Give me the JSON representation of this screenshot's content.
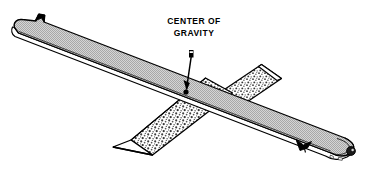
{
  "figure": {
    "type": "technical-line-illustration",
    "background_color": "#ffffff",
    "ink_color": "#000000",
    "annotation": {
      "label_line_1": "CENTER OF",
      "label_line_2": "GRAVITY",
      "label_x": 194,
      "label_y_line_1": 24,
      "label_y_line_2": 36,
      "pointer": {
        "kind": "arrow-with-dot",
        "from_x": 191,
        "from_y": 51,
        "to_x": 186,
        "to_y": 92,
        "dot_radius": 2.6,
        "dot_color": "#000000",
        "tail_flag": true
      }
    },
    "ruler": {
      "name": "steel-rule",
      "face_color": "#c9c9c9",
      "edge_color": "#ffffff",
      "outline_color": "#000000",
      "left_end_x": 14,
      "left_end_y": 22,
      "right_end_x": 369,
      "right_end_y": 150,
      "left_notch": true,
      "right_notch": true,
      "end_hole": {
        "cx": 351,
        "cy": 151,
        "r": 4.4,
        "color": "#1a1a1a",
        "highlight_color": "#d8d8d8"
      }
    },
    "fulcrum": {
      "name": "triangular-wedge-support",
      "face_color": "#ffffff",
      "stipple_color": "#4a4a4a",
      "outline_color": "#000000",
      "lower_tip_x": 113,
      "lower_tip_y": 147,
      "upper_tip_x": 262,
      "upper_tip_y": 64
    }
  }
}
